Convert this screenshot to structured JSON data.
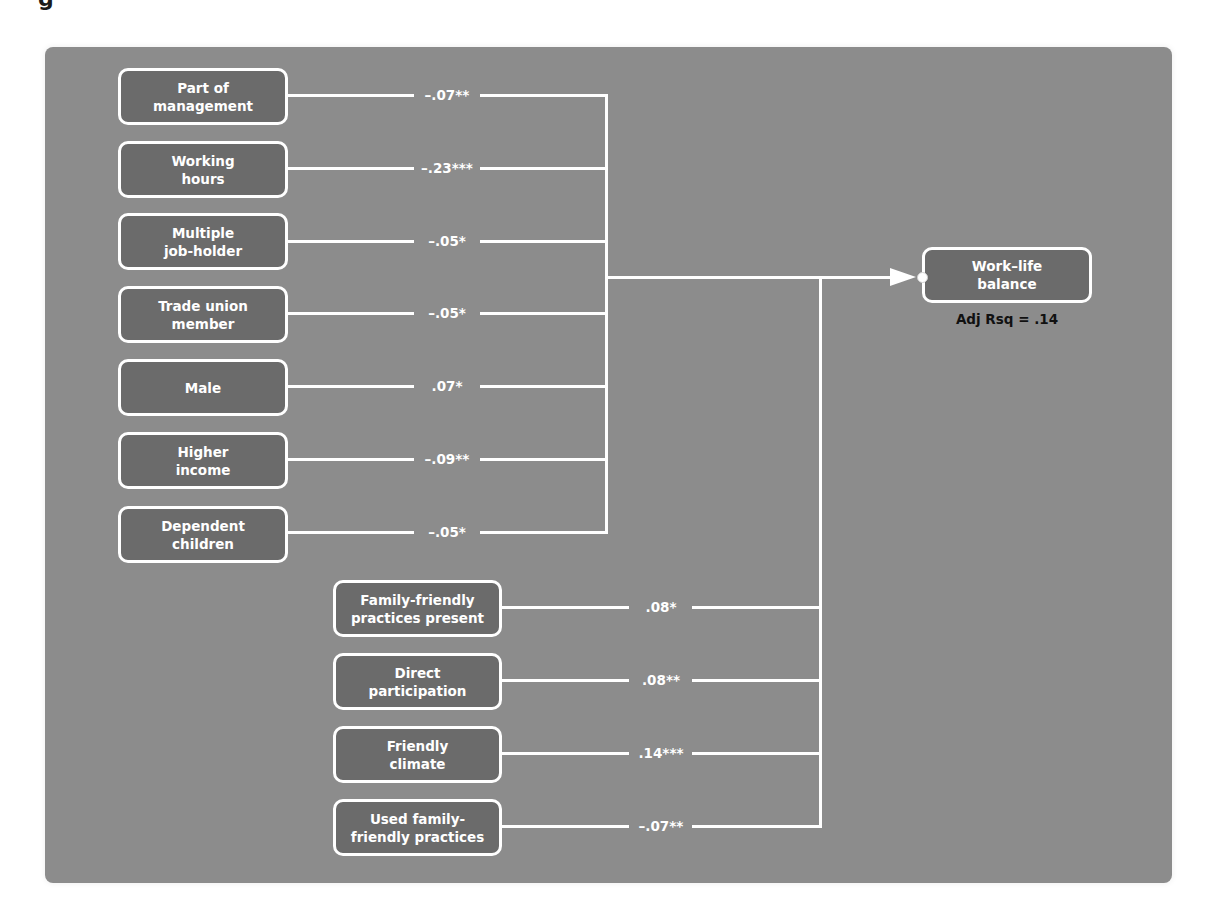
{
  "figure": {
    "partial_heading_glyph": "g"
  },
  "outcome": {
    "label": "Work–life\nbalance",
    "caption": "Adj Rsq = .14"
  },
  "individual_predictors": [
    {
      "label": "Part of\nmanagement",
      "coef": "–.07**"
    },
    {
      "label": "Working\nhours",
      "coef": "–.23***"
    },
    {
      "label": "Multiple\njob-holder",
      "coef": "–.05*"
    },
    {
      "label": "Trade union\nmember",
      "coef": "–.05*"
    },
    {
      "label": "Male",
      "coef": ".07*"
    },
    {
      "label": "Higher\nincome",
      "coef": "–.09**"
    },
    {
      "label": "Dependent\nchildren",
      "coef": "–.05*"
    }
  ],
  "workplace_predictors": [
    {
      "label": "Family-friendly\npractices present",
      "coef": ".08*"
    },
    {
      "label": "Direct\nparticipation",
      "coef": ".08**"
    },
    {
      "label": "Friendly\nclimate",
      "coef": ".14***"
    },
    {
      "label": "Used family-\nfriendly practices",
      "coef": "–.07**"
    }
  ],
  "colors": {
    "panel_bg": "#8c8c8c",
    "node_fill": "#6b6b6b",
    "line": "#ffffff",
    "caption_text": "#111111"
  }
}
